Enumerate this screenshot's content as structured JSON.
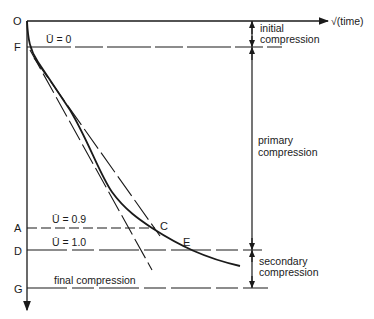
{
  "diagram": {
    "axis_x_label": "√(time)",
    "origin_label": "O",
    "points": {
      "F": "F",
      "A": "A",
      "D": "D",
      "G": "G",
      "C": "C",
      "E": "E"
    },
    "levels": {
      "u0": "Ū = 0",
      "u09": "Ū = 0.9",
      "u10": "Ū = 1.0",
      "final": "final compression"
    },
    "regions": {
      "initial_1": "initial",
      "initial_2": "compression",
      "primary_1": "primary",
      "primary_2": "compression",
      "secondary_1": "secondary",
      "secondary_2": "compression"
    },
    "colors": {
      "ink": "#1a1a1a",
      "background": "#ffffff"
    }
  }
}
